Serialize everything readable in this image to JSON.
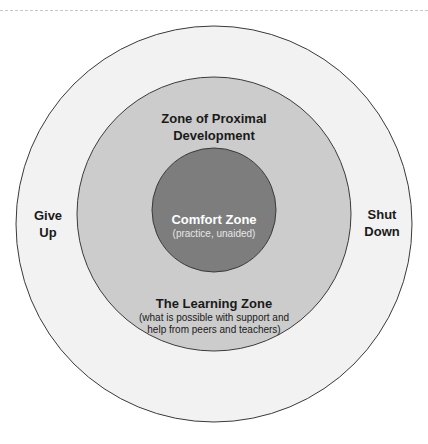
{
  "zones": {
    "outer": {
      "fill": "#f2f2f2",
      "left_label": "Give Up",
      "left_label_lines": [
        "Give",
        "Up"
      ],
      "right_label_lines": [
        "Shut",
        "Down"
      ]
    },
    "middle": {
      "fill": "#cccccc",
      "title_lines": [
        "Zone of Proximal",
        "Development"
      ],
      "bottom_title": "The Learning Zone",
      "bottom_desc_lines": [
        "(what is possible with support and",
        "help from peers and teachers)"
      ]
    },
    "inner": {
      "fill": "#7d7d7d",
      "title": "Comfort Zone",
      "subtitle": "(practice, unaided)"
    }
  }
}
